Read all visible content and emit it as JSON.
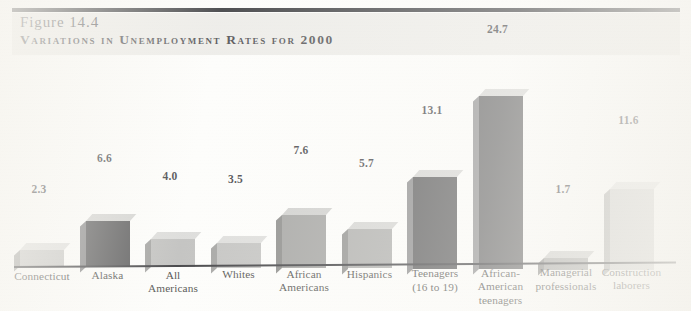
{
  "header": {
    "figure_number": "Figure 14.4",
    "figure_title": "Variations in Unemployment Rates for 2000"
  },
  "chart_data": {
    "type": "bar",
    "title": "Variations in Unemployment Rates for 2000",
    "xlabel": "",
    "ylabel": "",
    "ylim": [
      0,
      26
    ],
    "grid": false,
    "legend": "none",
    "value_labels": true,
    "categories": [
      "Connecticut",
      "Alaska",
      "All Americans",
      "Whites",
      "African Americans",
      "Hispanics",
      "Teenagers (16 to 19)",
      "African-American teenagers",
      "Managerial professionals",
      "Construction laborers"
    ],
    "values": [
      2.3,
      6.6,
      4.0,
      3.5,
      7.6,
      5.7,
      13.1,
      24.7,
      1.7,
      11.6
    ],
    "value_text": [
      "2.3",
      "6.6",
      "4.0",
      "3.5",
      "7.6",
      "5.7",
      "13.1",
      "24.7",
      "1.7",
      "11.6"
    ],
    "bar_colors": [
      "#b9b9b7",
      "#2e2e30",
      "#b2b2b0",
      "#b5b5b3",
      "#8d8d8b",
      "#9a9a98",
      "#2f2f31",
      "#3c3c3e",
      "#8f8f8d",
      "#c2c2c0"
    ],
    "bar_top_colors": [
      "#d8d8d6",
      "#c9c9c7",
      "#d4d4d2",
      "#d6d6d4",
      "#c4c4c2",
      "#cacac8",
      "#cbcbc9",
      "#cfcfcd",
      "#c1c1bf",
      "#dcdcda"
    ],
    "bar_side_colors": [
      "#8e8e8c",
      "#6a6a6c",
      "#8b8b89",
      "#8d8d8b",
      "#6f6f6d",
      "#767674",
      "#6d6d6f",
      "#757577",
      "#6c6c6a",
      "#989896"
    ]
  },
  "category_label_lines": [
    [
      "Connecticut"
    ],
    [
      "Alaska"
    ],
    [
      "All",
      "Americans"
    ],
    [
      "Whites"
    ],
    [
      "African",
      "Americans"
    ],
    [
      "Hispanics"
    ],
    [
      "Teenagers",
      "(16 to 19)"
    ],
    [
      "African-",
      "American",
      "teenagers"
    ],
    [
      "Managerial",
      "professionals"
    ],
    [
      "Construction",
      "laborers"
    ]
  ],
  "axis": {
    "baseline_color": "#101014"
  }
}
